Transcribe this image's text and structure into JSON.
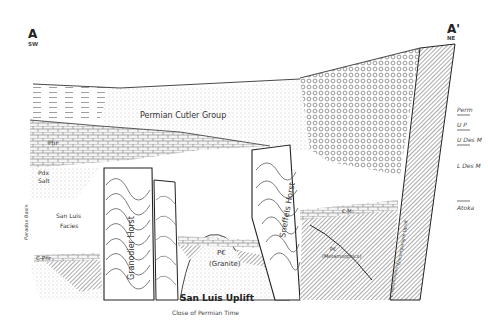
{
  "section": {
    "endpoint_left": {
      "letter": "A",
      "direction": "SW"
    },
    "endpoint_right": {
      "letter": "A'",
      "direction": "NE"
    }
  },
  "units": {
    "cutler": "Permian Cutler Group",
    "phr": "Phr",
    "pdx_salt_line1": "Pdx",
    "pdx_salt_line2": "Salt",
    "paradox_basin": "Paradox Basin",
    "san_luis_facies_line1": "San Luis",
    "san_luis_facies_line2": "Facies",
    "c_phr": "C-Phr",
    "granodier_horst": "Granodier Horst",
    "sneffels_horst": "Sneffels Horst",
    "pc_granite_line1": "P€",
    "pc_granite_line2": "(Granite)",
    "pc_meta_line1": "P€",
    "pc_meta_line2": "(Metamorphics)",
    "cm_label": "C-M",
    "uncompahgre_uplift": "Uncompahgre Uplift",
    "pc_meta_side": "P€ (Metamorphics)"
  },
  "right_legend": {
    "items": [
      {
        "label": "Perm"
      },
      {
        "label": "U P"
      },
      {
        "label": "U Des M"
      },
      {
        "label": "L Des M"
      },
      {
        "label": "Atoka"
      }
    ]
  },
  "caption": {
    "title": "San Luis Uplift",
    "subtitle": "Close of Permian Time"
  }
}
